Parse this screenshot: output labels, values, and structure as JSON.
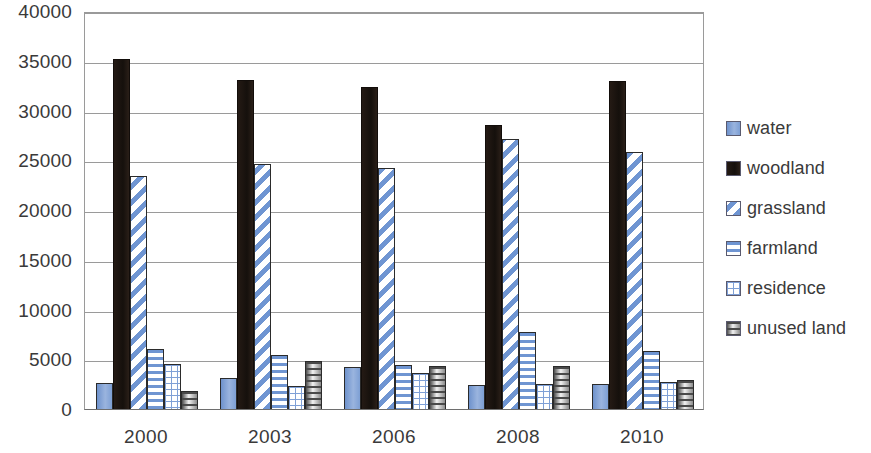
{
  "chart_data": {
    "type": "bar",
    "title": "",
    "xlabel": "",
    "ylabel": "",
    "categories": [
      "2000",
      "2003",
      "2006",
      "2008",
      "2010"
    ],
    "ylim": [
      0,
      40000
    ],
    "yticks": [
      0,
      5000,
      10000,
      15000,
      20000,
      25000,
      30000,
      35000,
      40000
    ],
    "ytick_labels": [
      "0",
      "5000",
      "10000",
      "15000",
      "20000",
      "25000",
      "30000",
      "35000",
      "40000"
    ],
    "grid": true,
    "legend_position": "right",
    "series": [
      {
        "name": "water",
        "pattern": "solid-blue",
        "color": "#7d9fd4",
        "values": [
          2600,
          3100,
          4200,
          2400,
          2500
        ]
      },
      {
        "name": "woodland",
        "pattern": "solid-black",
        "color": "#1c1410",
        "values": [
          35200,
          33100,
          32400,
          28500,
          33000
        ]
      },
      {
        "name": "grassland",
        "pattern": "diagonal-stripes",
        "color": "#6f95d2",
        "values": [
          23400,
          24600,
          24200,
          27100,
          25800
        ]
      },
      {
        "name": "farmland",
        "pattern": "horizontal-stripes",
        "color": "#6f95d2",
        "values": [
          6000,
          5400,
          4400,
          7700,
          5800
        ]
      },
      {
        "name": "residence",
        "pattern": "grid-crosshatch",
        "color": "#7fa0d6",
        "values": [
          4500,
          2300,
          3600,
          2500,
          2700
        ]
      },
      {
        "name": "unused land",
        "pattern": "dark-horizontal-grad",
        "color": "#4a4a4a",
        "values": [
          1800,
          4800,
          4300,
          4300,
          2900
        ]
      }
    ]
  },
  "legend": {
    "items": [
      {
        "label": "water"
      },
      {
        "label": "woodland"
      },
      {
        "label": "grassland"
      },
      {
        "label": "farmland"
      },
      {
        "label": "residence"
      },
      {
        "label": "unused land"
      }
    ]
  },
  "colors": {
    "blue": "#7d9fd4",
    "black": "#1c1410",
    "grey": "#4a4a4a",
    "gridline": "#9a9a9a",
    "text": "#3a3a3a",
    "background": "#ffffff"
  }
}
